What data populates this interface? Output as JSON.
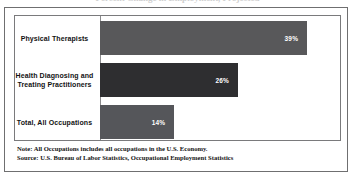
{
  "figure": {
    "clipped_title": "Percent Change in Employment, Projected",
    "note": "Note: All Occupations includes all occupations in the U.S. Economy.",
    "source": "Source: U.S. Bureau of Labor Statistics, Occupational Employment Statistics"
  },
  "chart_data": {
    "type": "bar",
    "orientation": "horizontal",
    "title": "",
    "xlabel": "",
    "ylabel": "",
    "grid": false,
    "legend": false,
    "xlim": [
      0,
      45
    ],
    "categories": [
      "Physical Therapists",
      "Health Diagnosing and Treating Practitioners",
      "Total, All Occupations"
    ],
    "category_lines": [
      [
        "Physical Therapists"
      ],
      [
        "Health Diagnosing and",
        "Treating Practitioners"
      ],
      [
        "Total, All Occupations"
      ]
    ],
    "values": [
      39,
      26,
      14
    ],
    "value_labels": [
      "39%",
      "26%",
      "14%"
    ],
    "bar_colors": [
      "#58585a",
      "#2e2e30",
      "#55565a"
    ]
  }
}
